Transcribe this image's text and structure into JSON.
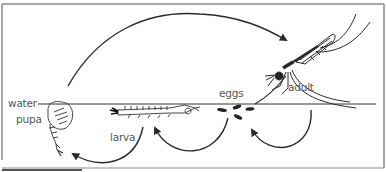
{
  "diagram": {
    "type": "life-cycle",
    "labels": {
      "water": "water",
      "pupa": "pupa",
      "larva": "larva",
      "eggs": "eggs",
      "adult": "adult"
    },
    "stages": [
      "eggs",
      "larva",
      "pupa",
      "adult"
    ],
    "colors": {
      "line": "#2a2a2a",
      "border": "#8a8a8a",
      "label": "#555555",
      "background": "#ffffff"
    }
  }
}
